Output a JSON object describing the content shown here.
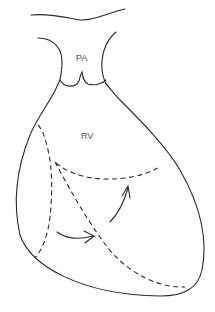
{
  "diagram": {
    "labels": {
      "pa": "PA",
      "rv": "RV"
    },
    "colors": {
      "line": "#2a2a2a",
      "text": "#555555",
      "background": "#ffffff"
    }
  }
}
